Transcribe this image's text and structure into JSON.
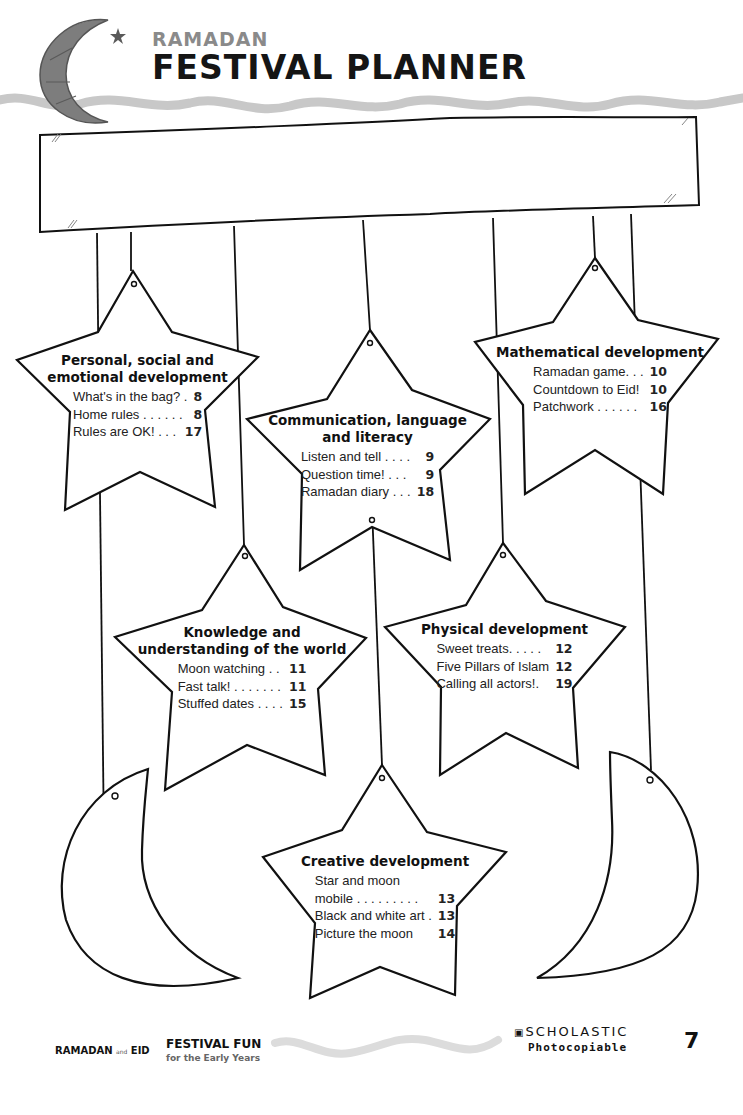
{
  "header": {
    "subtitle": "RAMADAN",
    "title": "FESTIVAL PLANNER",
    "logo_icon": "crescent-moon-star-icon"
  },
  "banner": {
    "label": ""
  },
  "stars": [
    {
      "heading": [
        "Personal, social and",
        "emotional development"
      ],
      "entries": [
        {
          "title": "What's in the bag? .",
          "page": "8"
        },
        {
          "title": "Home rules . . . . . .",
          "page": "8"
        },
        {
          "title": "Rules are OK! . . .",
          "page": "17"
        }
      ]
    },
    {
      "heading": [
        "Communication, language",
        "and literacy"
      ],
      "entries": [
        {
          "title": "Listen and tell . . . .",
          "page": "9"
        },
        {
          "title": "Question time! . . .",
          "page": "9"
        },
        {
          "title": "Ramadan diary . . .",
          "page": "18"
        }
      ]
    },
    {
      "heading": [
        "Mathematical development"
      ],
      "entries": [
        {
          "title": "Ramadan game. . .",
          "page": "10"
        },
        {
          "title": "Countdown to Eid!",
          "page": "10"
        },
        {
          "title": "Patchwork . . . . . .",
          "page": "16"
        }
      ]
    },
    {
      "heading": [
        "Knowledge and",
        "understanding of the world"
      ],
      "entries": [
        {
          "title": "Moon watching . .",
          "page": "11"
        },
        {
          "title": "Fast talk! . . . . . . .",
          "page": "11"
        },
        {
          "title": "Stuffed dates . . . .",
          "page": "15"
        }
      ]
    },
    {
      "heading": [
        "Physical development"
      ],
      "entries": [
        {
          "title": "Sweet treats. . . . .",
          "page": "12"
        },
        {
          "title": "Five Pillars of Islam",
          "page": "12"
        },
        {
          "title": "Calling all actors!.",
          "page": "19"
        }
      ]
    },
    {
      "heading": [
        "Creative development"
      ],
      "entries": [
        {
          "title": "Star and moon",
          "page": ""
        },
        {
          "title": "mobile . . . . . . . . .",
          "page": "13"
        },
        {
          "title": "Black and white art .",
          "page": "13"
        },
        {
          "title": "Picture the moon",
          "page": "14"
        }
      ]
    }
  ],
  "footer": {
    "series_left": "RAMADAN",
    "series_and": "and",
    "series_right": "EID",
    "brand": "FESTIVAL FUN",
    "brand_sub": "for the Early Years",
    "publisher": "SCHOLASTIC",
    "publisher_icon": "book-icon",
    "photocopiable": "Photocopiable",
    "page_number": "7"
  },
  "colors": {
    "ink": "#111111",
    "wave": "#c8c8c8",
    "header_sub": "#8a8a8a",
    "logo_moon": "#7d7d7d"
  }
}
